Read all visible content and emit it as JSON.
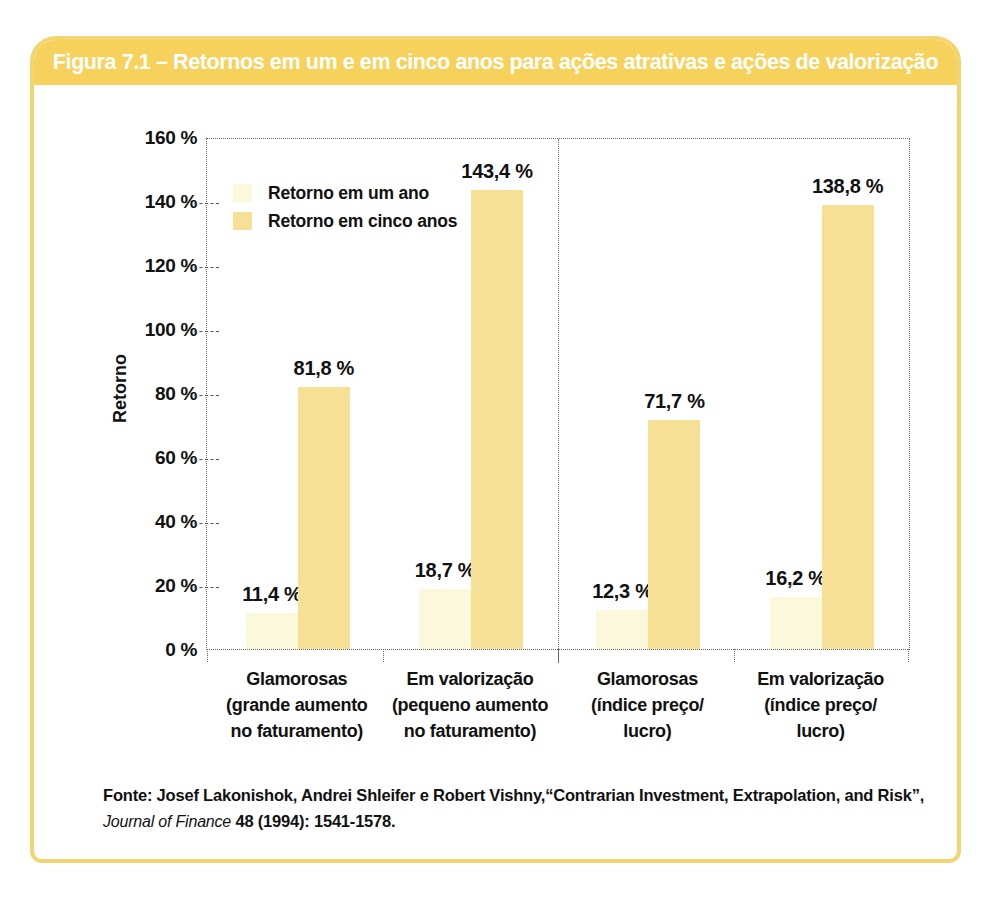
{
  "figure": {
    "title": "Figura 7.1 – Retornos em um e em cinco anos para ações atrativas e ações de valorização"
  },
  "colors": {
    "banner": "#f6d25c",
    "panel_border": "#f2d470",
    "bar_one_year": "#fcf8dc",
    "bar_five_years": "#f5e096",
    "axis_line": "#6a6a6a",
    "title_text": "#ffffff",
    "text": "#111111"
  },
  "chart_data": {
    "type": "bar",
    "title": "Figura 7.1 – Retornos em um e em cinco anos para ações atrativas e ações de valorização",
    "xlabel": "",
    "ylabel": "Retorno",
    "ylim": [
      0,
      160
    ],
    "ytick_step": 20,
    "ytick_labels": [
      "0 %",
      "20 %",
      "40 %",
      "60 %",
      "80 %",
      "100 %",
      "120 %",
      "140 %",
      "160 %"
    ],
    "grid": "dotted frame, dashed y-ticks on axis, no inner gridlines",
    "legend_position": "upper-left inside plot",
    "legend": [
      {
        "name": "Retorno em um ano",
        "color_key": "bar_one_year"
      },
      {
        "name": "Retorno em cinco anos",
        "color_key": "bar_five_years"
      }
    ],
    "categories": [
      {
        "label": "Glamorosas (grande aumento no faturamento)",
        "lines": [
          "Glamorosas",
          "(grande aumento",
          "no faturamento)"
        ]
      },
      {
        "label": "Em valorização (pequeno aumento no faturamento)",
        "lines": [
          "Em valorização",
          "(pequeno aumento",
          "no faturamento)"
        ]
      },
      {
        "label": "Glamorosas (índice preço/lucro)",
        "lines": [
          "Glamorosas",
          "(índice preço/",
          "lucro)"
        ]
      },
      {
        "label": "Em valorização (índice preço/lucro)",
        "lines": [
          "Em valorização",
          "(índice preço/",
          "lucro)"
        ]
      }
    ],
    "series": [
      {
        "name": "Retorno em um ano",
        "values": [
          11.4,
          18.7,
          12.3,
          16.2
        ],
        "value_labels": [
          "11,4 %",
          "18,7 %",
          "12,3 %",
          "16,2 %"
        ]
      },
      {
        "name": "Retorno em cinco anos",
        "values": [
          81.8,
          143.4,
          71.7,
          138.8
        ],
        "value_labels": [
          "81,8 %",
          "143,4 %",
          "71,7 %",
          "138,8 %"
        ]
      }
    ],
    "panel_divider_after_category_index": 1
  },
  "source": {
    "line1": "Fonte: Josef Lakonishok, Andrei Shleifer e Robert Vishny,“Contrarian Investment, Extrapolation, and Risk”,",
    "line2_italic": "Journal of Finance",
    "line2_rest": "  48 (1994): 1541-1578."
  }
}
